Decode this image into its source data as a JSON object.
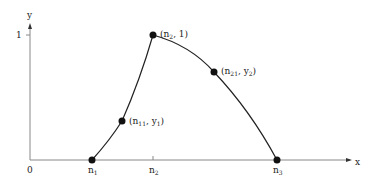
{
  "axes": {
    "x_label": "x",
    "y_label": "y",
    "origin_label": "0",
    "y_tick_label": "1"
  },
  "x_ticks": [
    {
      "base": "n",
      "sub": "1"
    },
    {
      "base": "n",
      "sub": "2"
    },
    {
      "base": "n",
      "sub": "3"
    }
  ],
  "points": [
    {
      "id": "n1",
      "label": ""
    },
    {
      "id": "n11-y1",
      "label_base": "(n",
      "label_sub": "11",
      "label_rest": ", y",
      "label_sub2": "1",
      "label_end": ")"
    },
    {
      "id": "n2-1",
      "label_base": "(n",
      "label_sub": "2",
      "label_rest": ", 1",
      "label_end": ")"
    },
    {
      "id": "n21-y2",
      "label_base": "(n",
      "label_sub": "21",
      "label_rest": ", y",
      "label_sub2": "2",
      "label_end": ")"
    },
    {
      "id": "n3",
      "label": ""
    }
  ],
  "colors": {
    "axis": "#888888",
    "curve": "#222222",
    "point": "#111111"
  }
}
